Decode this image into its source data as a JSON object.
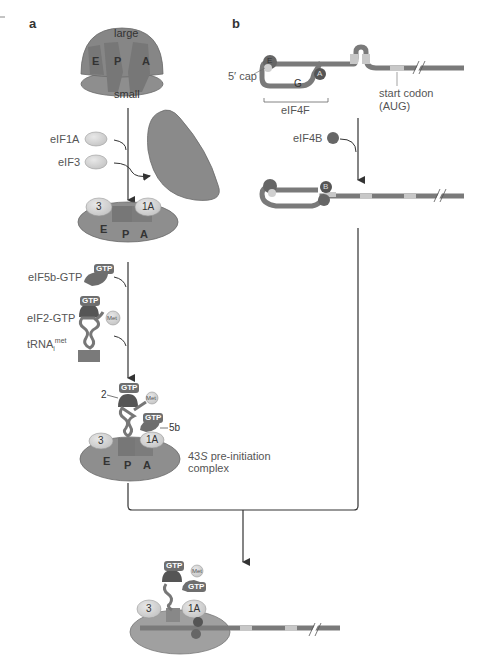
{
  "panels": {
    "a": "a",
    "b": "b"
  },
  "panel_a": {
    "ribosome": {
      "large": "large",
      "small": "small",
      "sites": [
        "E",
        "P",
        "A"
      ]
    },
    "factors_step1": [
      "eIF1A",
      "eIF3"
    ],
    "bound_step1": {
      "f3": "3",
      "f1a": "1A",
      "sites": [
        "E",
        "P",
        "A"
      ]
    },
    "factors_step2": {
      "eif5b": "eIF5b-GTP",
      "eif2": "eIF2-GTP",
      "trna": "tRNA",
      "trna_sub": "i",
      "trna_sup": "met",
      "gtp": "GTP",
      "met": "Met"
    },
    "complex": {
      "f2": "2",
      "f5b": "5b",
      "f3": "3",
      "f1a": "1A",
      "sites": [
        "E",
        "P",
        "A"
      ],
      "gtp": "GTP",
      "met": "Met",
      "label_prefix": "43",
      "label_italic": "S",
      "label_line1_rest": " pre-initiation",
      "label_line2": "complex"
    }
  },
  "panel_b": {
    "cap_label": "5′ cap",
    "eif4f_label": "eIF4F",
    "eif4e": "E",
    "eif4g": "G",
    "eif4a": "A",
    "start_codon": "start codon",
    "start_codon_sub": "(AUG)",
    "eif4b_label": "eIF4B",
    "eif4b_letter": "B"
  },
  "final": {
    "f3": "3",
    "f1a": "1A",
    "gtp1": "GTP",
    "gtp2": "GTP",
    "met": "Met"
  },
  "colors": {
    "ribosome": "#8a8a8a",
    "ribosome_dark": "#777777",
    "mrna": "#7a7a7a",
    "light_factor": "#d8d8d8",
    "gtp_chip": "#6e6e6e",
    "arrow": "#333333"
  }
}
